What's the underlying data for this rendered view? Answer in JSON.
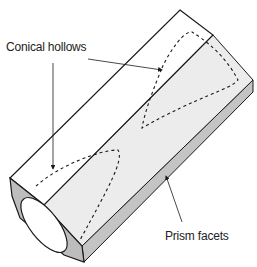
{
  "diagram": {
    "labels": {
      "conical_hollows": "Conical hollows",
      "prism_facets": "Prism facets"
    },
    "colors": {
      "outline": "#1a1a1a",
      "top_face": "#ffffff",
      "inner_face": "#ececec",
      "side_face": "#c8c8c8",
      "front_face": "#bdbdbd",
      "hollow": "#ffffff"
    }
  }
}
